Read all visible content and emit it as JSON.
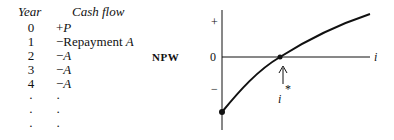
{
  "table": {
    "headers": {
      "year": "Year",
      "cash_flow": "Cash flow"
    },
    "rows": [
      {
        "year": "0",
        "sign": "+",
        "text": "",
        "var": "P"
      },
      {
        "year": "1",
        "sign": "−",
        "text": "Repayment ",
        "var": "A"
      },
      {
        "year": "2",
        "sign": "−",
        "text": "",
        "var": "A"
      },
      {
        "year": "3",
        "sign": "−",
        "text": "",
        "var": "A"
      },
      {
        "year": "4",
        "sign": "−",
        "text": "",
        "var": "A"
      },
      {
        "year": "·",
        "sign": "·",
        "text": "",
        "var": ""
      },
      {
        "year": "·",
        "sign": "·",
        "text": "",
        "var": ""
      },
      {
        "year": "·",
        "sign": "·",
        "text": "",
        "var": ""
      }
    ]
  },
  "chart_data": {
    "type": "line",
    "title": "",
    "ylabel": "NPW",
    "xlabel": "i",
    "y_tick_labels": [
      "+",
      "0",
      "−"
    ],
    "annotation": "i*",
    "annotation_desc": "arrow pointing to zero-crossing (internal rate of return)",
    "series": [
      {
        "name": "NPW(i)",
        "description": "concave increasing curve starting negative at i=0, crossing zero at i*, positive thereafter",
        "x": [
          0,
          0.25,
          0.4,
          0.6,
          0.8,
          1.0
        ],
        "y": [
          -1.0,
          -0.45,
          0.0,
          0.35,
          0.65,
          0.9
        ]
      }
    ],
    "grid": false,
    "legend": null
  }
}
